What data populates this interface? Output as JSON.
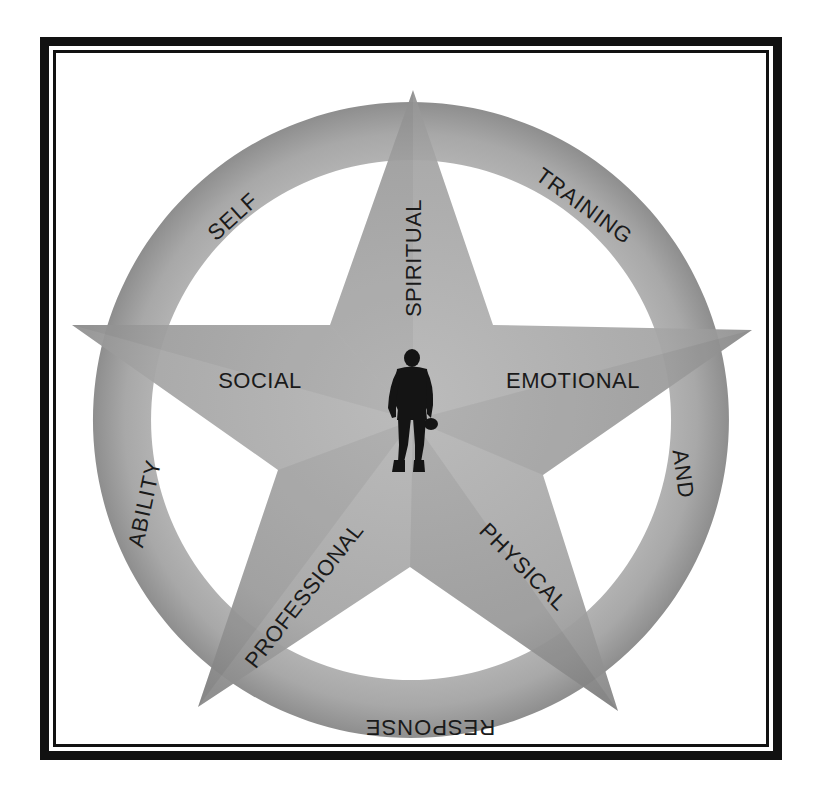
{
  "diagram": {
    "colors": {
      "frame": "#111111",
      "ring_fill": "#a9a9a9",
      "star_fill": "#a4a4a4",
      "text": "#1a1a1a",
      "figure": "#141414",
      "background": "#ffffff"
    },
    "ring_labels": {
      "self": "SELF",
      "training": "TRAINING",
      "and": "AND",
      "response": "RESPONSE",
      "ability": "ABILITY"
    },
    "star_labels": {
      "spiritual": "SPIRITUAL",
      "social": "SOCIAL",
      "emotional": "EMOTIONAL",
      "professional": "PROFESSIONAL",
      "physical": "PHYSICAL"
    },
    "center_figure": "soldier-silhouette"
  }
}
